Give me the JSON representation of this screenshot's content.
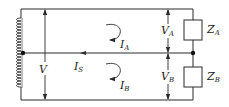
{
  "figure": {
    "type": "circuit-diagram",
    "colors": {
      "stroke": "#2a2a2a",
      "background": "#ffffff"
    }
  },
  "labels": {
    "source_voltage": "V",
    "source_current": {
      "main": "I",
      "sub": "S"
    },
    "loop_current_a": {
      "main": "I",
      "sub": "A"
    },
    "loop_current_b": {
      "main": "I",
      "sub": "B"
    },
    "voltage_a": {
      "main": "V",
      "sub": "A"
    },
    "voltage_b": {
      "main": "V",
      "sub": "B"
    },
    "impedance_a": {
      "main": "Z",
      "sub": "A"
    },
    "impedance_b": {
      "main": "Z",
      "sub": "B"
    }
  },
  "components": [
    {
      "id": "coil",
      "kind": "winding",
      "symbol": "inductor-coil"
    },
    {
      "id": "Z_A",
      "kind": "impedance",
      "symbol": "rectangle"
    },
    {
      "id": "Z_B",
      "kind": "impedance",
      "symbol": "rectangle"
    },
    {
      "id": "centre-tap",
      "kind": "junction"
    },
    {
      "id": "load-junction",
      "kind": "junction"
    }
  ]
}
